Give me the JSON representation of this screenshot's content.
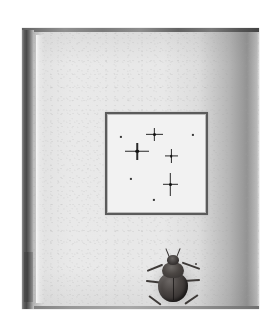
{
  "scene": {
    "description": "Scanned photograph of an open book page",
    "background_color": "#ffffff",
    "width": 279,
    "height": 328
  },
  "page": {
    "name": "book-page",
    "paper_color": "#e8e8e8",
    "spine_color": "#4a4a4a",
    "top_edge_color": "#5a5a5a",
    "curl_shadow_color": "#5f5f5f"
  },
  "star_plate": {
    "name": "framed-star-plate",
    "border_color": "#5b5b5b",
    "field_color": "#f2f2f2",
    "star_color": "#2a2a2a",
    "stars": [
      {
        "id": "star-top-center",
        "x": 46,
        "y": 19,
        "spike_h": 17,
        "spike_v": 13,
        "thickness": 1.3,
        "core": 3.0
      },
      {
        "id": "star-mid-left",
        "x": 29,
        "y": 36,
        "spike_h": 24,
        "spike_v": 17,
        "thickness": 1.5,
        "core": 3.6
      },
      {
        "id": "star-mid-right",
        "x": 63,
        "y": 41,
        "spike_h": 13,
        "spike_v": 14,
        "thickness": 1.2,
        "core": 2.6
      },
      {
        "id": "star-lower-right",
        "x": 62,
        "y": 69,
        "spike_h": 15,
        "spike_v": 23,
        "thickness": 1.4,
        "core": 3.0
      }
    ],
    "dots": [
      {
        "id": "dot-upper-left",
        "x": 13,
        "y": 22,
        "size": 2.2
      },
      {
        "id": "dot-upper-right",
        "x": 85,
        "y": 20,
        "size": 2.2
      },
      {
        "id": "dot-lower-left",
        "x": 23,
        "y": 64,
        "size": 2.2
      },
      {
        "id": "dot-bottom",
        "x": 46,
        "y": 85,
        "size": 2.2
      }
    ]
  },
  "beetle": {
    "name": "beetle-illustration",
    "body_color": "#332f2e",
    "highlight_color": "#6b6664",
    "leg_color": "#3e3a38",
    "antennae": [
      {
        "id": "antenna-left",
        "left": 22,
        "top": 0,
        "height": 9,
        "rotate": -22
      },
      {
        "id": "antenna-right",
        "left": 33,
        "top": 0,
        "height": 9,
        "rotate": 22
      }
    ],
    "legs": [
      {
        "id": "leg-front-left",
        "side": "left",
        "left": 2,
        "top": 22,
        "width": 17,
        "rotate": -22
      },
      {
        "id": "leg-mid-left",
        "side": "left",
        "left": 1,
        "top": 32,
        "width": 17,
        "rotate": 6
      },
      {
        "id": "leg-hind-left",
        "side": "left",
        "left": 4,
        "top": 47,
        "width": 15,
        "rotate": 36
      },
      {
        "id": "leg-front-right",
        "side": "right",
        "left": 36,
        "top": 20,
        "width": 19,
        "rotate": 20
      },
      {
        "id": "leg-mid-right",
        "side": "right",
        "left": 38,
        "top": 31,
        "width": 17,
        "rotate": -4
      },
      {
        "id": "leg-hind-right",
        "side": "right",
        "left": 37,
        "top": 46,
        "width": 16,
        "rotate": -34
      }
    ],
    "leg_tips": [
      {
        "id": "leg-tip-front-right",
        "left": 50,
        "top": 15
      }
    ]
  }
}
